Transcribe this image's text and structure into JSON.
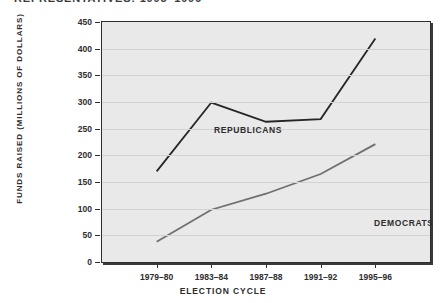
{
  "title": "REPRESENTATIVES: 1995–1996",
  "axis": {
    "x_title": "Election Cycle",
    "y_title": "Funds Raised (Millions of Dollars)"
  },
  "series_labels": {
    "republicans": "Republicans",
    "democrats": "Democrats"
  },
  "colors": {
    "republicans": "#262626",
    "democrats": "#6f6f6f",
    "plot_background": "#e9e9e9",
    "gridline": "#d2d2d2",
    "frame": "#2e2e2e"
  },
  "chart_data": {
    "type": "line",
    "title": "REPRESENTATIVES: 1995–1996",
    "xlabel": "Election Cycle",
    "ylabel": "Funds Raised (Millions of Dollars)",
    "categories": [
      "1979–80",
      "1983–84",
      "1987–88",
      "1991–92",
      "1995–96"
    ],
    "ylim": [
      0,
      450
    ],
    "yticks": [
      0,
      50,
      100,
      150,
      200,
      250,
      300,
      350,
      400,
      450
    ],
    "ytick_labels": [
      "0",
      "50",
      "100",
      "150",
      "200",
      "250",
      "300",
      "350",
      "400",
      "450"
    ],
    "grid": true,
    "legend": "inline-annotations",
    "series": [
      {
        "name": "Republicans",
        "values": [
          170,
          299,
          263,
          268,
          419
        ],
        "color": "#262626"
      },
      {
        "name": "Democrats",
        "values": [
          38,
          98,
          128,
          165,
          221
        ],
        "color": "#6f6f6f"
      }
    ]
  }
}
